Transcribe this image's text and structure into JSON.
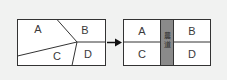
{
  "diagram": {
    "before": {
      "parcels": [
        {
          "id": "A",
          "label": "A"
        },
        {
          "id": "B",
          "label": "B"
        },
        {
          "id": "C",
          "label": "C"
        },
        {
          "id": "D",
          "label": "D"
        }
      ]
    },
    "arrow": {
      "direction": "right"
    },
    "after": {
      "parcels": [
        {
          "id": "A",
          "label": "A"
        },
        {
          "id": "B",
          "label": "B"
        },
        {
          "id": "C",
          "label": "C"
        },
        {
          "id": "D",
          "label": "D"
        }
      ],
      "road": {
        "label_1": "農",
        "label_2": "道",
        "color": "#8a8a8a"
      }
    }
  }
}
